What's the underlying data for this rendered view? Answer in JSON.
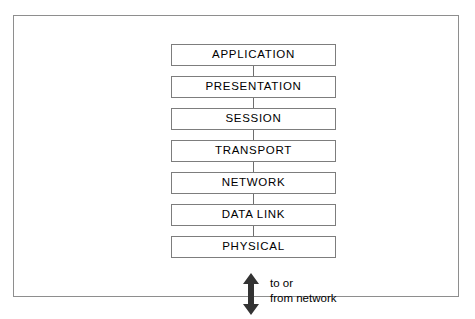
{
  "diagram": {
    "frame": {
      "border_color": "#8e8e8e"
    },
    "box_style": {
      "border_color": "#7d7d7d",
      "fill_color": "#ffffff",
      "text_color": "#000000"
    },
    "layers": [
      {
        "label": "APPLICATION"
      },
      {
        "label": "PRESENTATION"
      },
      {
        "label": "SESSION"
      },
      {
        "label": "TRANSPORT"
      },
      {
        "label": "NETWORK"
      },
      {
        "label": "DATA LINK"
      },
      {
        "label": "PHYSICAL"
      }
    ],
    "network_link": {
      "arrow_icon": "double-headed-vertical-arrow",
      "arrow_color": "#333333",
      "caption_line_1": "to or",
      "caption_line_2": "from network"
    }
  }
}
